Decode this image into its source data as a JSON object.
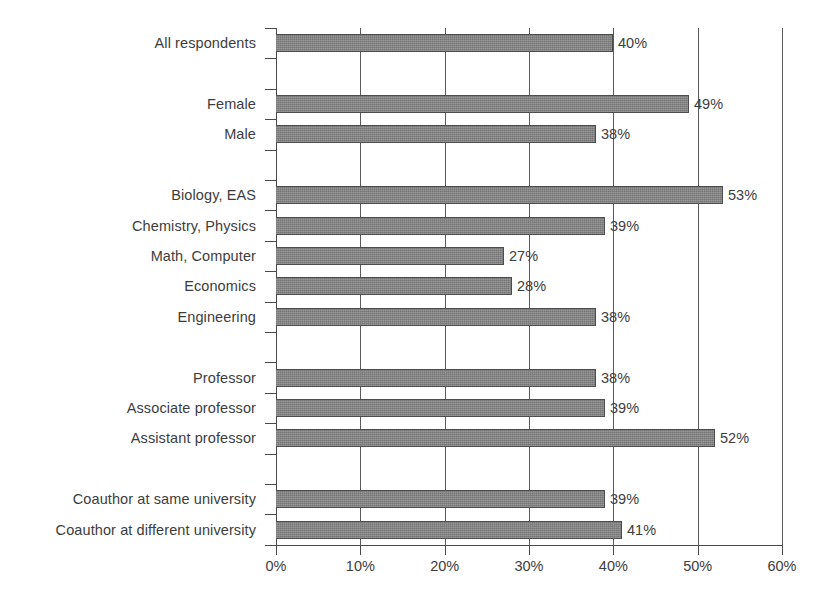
{
  "chart_data": {
    "type": "bar",
    "orientation": "horizontal",
    "title": "",
    "subtitle": "",
    "xlabel": "",
    "ylabel": "",
    "xlim": [
      0,
      60
    ],
    "xticks": [
      "0%",
      "10%",
      "20%",
      "30%",
      "40%",
      "50%",
      "60%"
    ],
    "xtick_values": [
      0,
      10,
      20,
      30,
      40,
      50,
      60
    ],
    "grid": "vertical",
    "legend": "none",
    "value_label_suffix": "%",
    "bar_color": "#7d7d7d",
    "bar_outline_color": "#4d4d4d",
    "axis_color": "#4a4a4a",
    "text_color": "#3d3d3d",
    "categories": [
      "All respondents",
      "Female",
      "Male",
      "Biology, EAS",
      "Chemistry, Physics",
      "Math, Computer",
      "Economics",
      "Engineering",
      "Professor",
      "Associate professor",
      "Assistant professor",
      "Coauthor at same university",
      "Coauthor at different university"
    ],
    "values": [
      40,
      49,
      38,
      53,
      39,
      27,
      28,
      38,
      38,
      39,
      52,
      39,
      41
    ],
    "value_labels": [
      "40%",
      "49%",
      "38%",
      "53%",
      "39%",
      "27%",
      "28%",
      "38%",
      "38%",
      "39%",
      "52%",
      "39%",
      "41%"
    ],
    "groups": [
      {
        "name": "overall",
        "categories": [
          "All respondents"
        ]
      },
      {
        "name": "gender",
        "categories": [
          "Female",
          "Male"
        ]
      },
      {
        "name": "field",
        "categories": [
          "Biology, EAS",
          "Chemistry, Physics",
          "Math, Computer",
          "Economics",
          "Engineering"
        ]
      },
      {
        "name": "rank",
        "categories": [
          "Professor",
          "Associate professor",
          "Assistant professor"
        ]
      },
      {
        "name": "coauthor",
        "categories": [
          "Coauthor at same university",
          "Coauthor at different university"
        ]
      }
    ],
    "slots": [
      {
        "kind": "bar",
        "category": "All respondents",
        "value": 40,
        "label": "40%"
      },
      {
        "kind": "gap",
        "category": "",
        "value": null,
        "label": ""
      },
      {
        "kind": "bar",
        "category": "Female",
        "value": 49,
        "label": "49%"
      },
      {
        "kind": "bar",
        "category": "Male",
        "value": 38,
        "label": "38%"
      },
      {
        "kind": "gap",
        "category": "",
        "value": null,
        "label": ""
      },
      {
        "kind": "bar",
        "category": "Biology, EAS",
        "value": 53,
        "label": "53%"
      },
      {
        "kind": "bar",
        "category": "Chemistry, Physics",
        "value": 39,
        "label": "39%"
      },
      {
        "kind": "bar",
        "category": "Math, Computer",
        "value": 27,
        "label": "27%"
      },
      {
        "kind": "bar",
        "category": "Economics",
        "value": 28,
        "label": "28%"
      },
      {
        "kind": "bar",
        "category": "Engineering",
        "value": 38,
        "label": "38%"
      },
      {
        "kind": "gap",
        "category": "",
        "value": null,
        "label": ""
      },
      {
        "kind": "bar",
        "category": "Professor",
        "value": 38,
        "label": "38%"
      },
      {
        "kind": "bar",
        "category": "Associate professor",
        "value": 39,
        "label": "39%"
      },
      {
        "kind": "bar",
        "category": "Assistant professor",
        "value": 52,
        "label": "52%"
      },
      {
        "kind": "gap",
        "category": "",
        "value": null,
        "label": ""
      },
      {
        "kind": "bar",
        "category": "Coauthor at same university",
        "value": 39,
        "label": "39%"
      },
      {
        "kind": "bar",
        "category": "Coauthor at different university",
        "value": 41,
        "label": "41%"
      }
    ]
  }
}
